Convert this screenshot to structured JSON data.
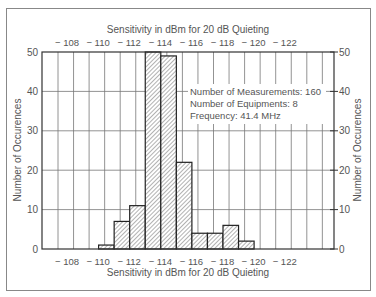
{
  "chart_data": {
    "type": "bar",
    "title": "",
    "xlabel": "Sensitivity in dBm for 20 dB Quieting",
    "xlabel_top": "Sensitivity in dBm for 20 dB Quieting",
    "ylabel": "Number of Occurences",
    "ylabel_right": "Number of Occurences",
    "x_tick_labels": [
      "− 108",
      "− 110",
      "− 112",
      "− 114",
      "− 116",
      "− 118",
      "− 120",
      "− 122"
    ],
    "x_ticks": [
      -108,
      -110,
      -112,
      -114,
      -116,
      -118,
      -120,
      -122
    ],
    "y_ticks": [
      0,
      10,
      20,
      30,
      40,
      50
    ],
    "ylim": [
      0,
      50
    ],
    "grid": true,
    "categories": [
      -110.5,
      -111.5,
      -112.5,
      -113.5,
      -114.5,
      -115.5,
      -116.5,
      -117.5,
      -118.5,
      -119.5
    ],
    "values": [
      1,
      7,
      11,
      50,
      49,
      22,
      4,
      4,
      6,
      2
    ],
    "annotations": [
      "Number of Measurements: 160",
      "Number of Equipments: 8",
      "Frequency: 41.4 MHz"
    ]
  }
}
